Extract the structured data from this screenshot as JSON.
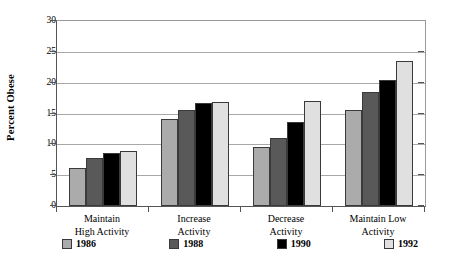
{
  "chart_data": {
    "type": "bar",
    "title": "",
    "xlabel": "",
    "ylabel": "Percent Obese",
    "ylim": [
      0,
      30
    ],
    "ytick_step": 5,
    "yticks": [
      "0",
      "5",
      "10",
      "15",
      "20",
      "25",
      "30"
    ],
    "grid": true,
    "legend_position": "bottom",
    "categories": [
      "Maintain High Activity",
      "Increase Activity",
      "Decrease Activity",
      "Maintain Low Activity"
    ],
    "category_lines": [
      [
        "Maintain",
        "High Activity"
      ],
      [
        "Increase",
        "Activity"
      ],
      [
        "Decrease",
        "Activity"
      ],
      [
        "Maintain Low",
        "Activity"
      ]
    ],
    "series": [
      {
        "name": "1986",
        "color": "#ababab",
        "values": [
          6.2,
          14.1,
          9.5,
          15.5
        ]
      },
      {
        "name": "1988",
        "color": "#595959",
        "values": [
          7.8,
          15.6,
          11.0,
          18.5
        ]
      },
      {
        "name": "1990",
        "color": "#000000",
        "values": [
          8.6,
          16.7,
          13.6,
          20.5
        ]
      },
      {
        "name": "1992",
        "color": "#e0e0e0",
        "values": [
          8.9,
          16.9,
          17.0,
          23.5
        ]
      }
    ]
  },
  "axis": {
    "y_title": "Percent Obese"
  },
  "legend": {
    "items": [
      {
        "label": "1986",
        "color": "#ababab"
      },
      {
        "label": "1988",
        "color": "#595959"
      },
      {
        "label": "1990",
        "color": "#000000"
      },
      {
        "label": "1992",
        "color": "#e0e0e0"
      }
    ]
  }
}
